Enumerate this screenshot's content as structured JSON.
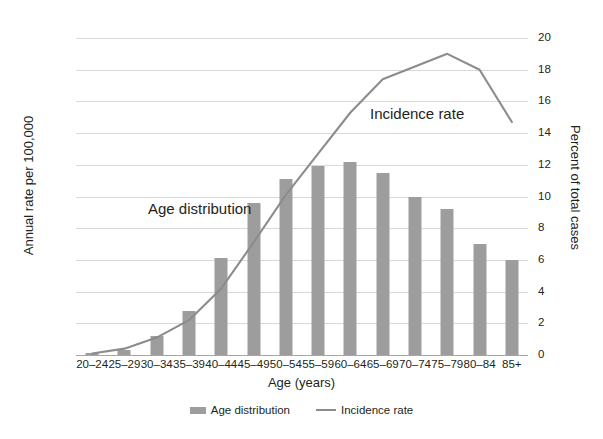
{
  "chart_data": {
    "type": "bar",
    "title": "",
    "xlabel": "Age (years)",
    "ylabel": "Annual rate per 100,000",
    "y2label": "Percent of total cases",
    "categories": [
      "20–24",
      "25–29",
      "30–34",
      "35–39",
      "40–44",
      "45–49",
      "50–54",
      "55–59",
      "60–64",
      "65–69",
      "70–74",
      "75–79",
      "80–84",
      "85+"
    ],
    "ylim": [
      0,
      500
    ],
    "yticks": [
      0,
      50,
      100,
      150,
      200,
      250,
      300,
      350,
      400,
      450,
      500
    ],
    "y2lim": [
      0,
      20
    ],
    "y2ticks": [
      0,
      2,
      4,
      6,
      8,
      10,
      12,
      14,
      16,
      18,
      20
    ],
    "grid": true,
    "legend_position": "bottom",
    "series": [
      {
        "name": "Age distribution",
        "type": "bar",
        "axis": "right",
        "unit": "percent of total cases",
        "color": "#9d9d9d",
        "values": [
          0.1,
          0.3,
          1.2,
          2.8,
          6.1,
          9.6,
          11.1,
          11.9,
          12.2,
          11.5,
          10.0,
          9.2,
          7.0,
          6.0
        ],
        "values_left_axis_equivalent": [
          2,
          8,
          30,
          70,
          154,
          243,
          282,
          302,
          310,
          291,
          254,
          233,
          178,
          152
        ]
      },
      {
        "name": "Incidence rate",
        "type": "line",
        "axis": "right",
        "unit": "percent of total cases",
        "color": "#8c8c8c",
        "values": [
          0.1,
          0.4,
          1.1,
          2.2,
          4.2,
          7.1,
          10.1,
          12.7,
          15.3,
          17.4,
          18.2,
          19.0,
          18.0,
          14.7
        ]
      }
    ],
    "annotations": [
      {
        "text": "Age distribution",
        "x": "35–39",
        "y": 230
      },
      {
        "text": "Incidence rate",
        "x": "70–74",
        "y": 390
      }
    ],
    "legend": [
      {
        "label": "Age distribution",
        "marker": "bar-swatch",
        "color": "#9d9d9d"
      },
      {
        "label": "Incidence rate",
        "marker": "line-swatch",
        "color": "#8c8c8c"
      }
    ]
  }
}
